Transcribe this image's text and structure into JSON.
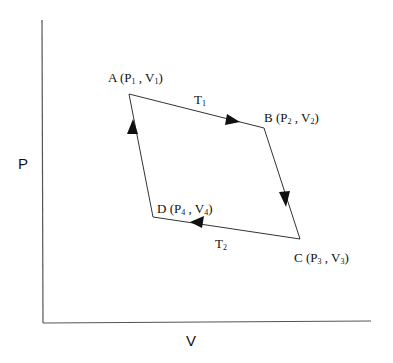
{
  "diagram": {
    "title": "",
    "axes": {
      "x_label": "V",
      "y_label": "P"
    },
    "points": [
      {
        "id": "A",
        "label": "A",
        "p": "P",
        "p_sub": "1",
        "v": "V",
        "v_sub": "1"
      },
      {
        "id": "B",
        "label": "B",
        "p": "P",
        "p_sub": "2",
        "v": "V",
        "v_sub": "2"
      },
      {
        "id": "C",
        "label": "C",
        "p": "P",
        "p_sub": "3",
        "v": "V",
        "v_sub": "3"
      },
      {
        "id": "D",
        "label": "D",
        "p": "P",
        "p_sub": "4",
        "v": "V",
        "v_sub": "4"
      }
    ],
    "edges": [
      {
        "from": "A",
        "to": "B",
        "label": "T",
        "label_sub": "1"
      },
      {
        "from": "B",
        "to": "C",
        "label": ""
      },
      {
        "from": "C",
        "to": "D",
        "label": "T",
        "label_sub": "2"
      },
      {
        "from": "D",
        "to": "A",
        "label": ""
      }
    ],
    "colors": {
      "line": "#333333",
      "text": "#111111",
      "background": "#ffffff"
    }
  }
}
